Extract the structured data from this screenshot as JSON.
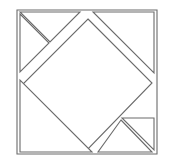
{
  "figure": {
    "title": "Tangram Square Dissection",
    "type": "line-drawing",
    "canvas": {
      "width": 169,
      "height": 166,
      "background": "#ffffff"
    },
    "style": {
      "stroke_color": "#6b6b6b",
      "stroke_width": 1.1,
      "fill_color": "#ffffff",
      "line_join": "miter"
    },
    "pieces": [
      {
        "name": "outer-square-border",
        "label": "Outer Square",
        "points": "17,10 157,10 157,154 17,154"
      },
      {
        "name": "center-diamond",
        "label": "Center Diamond",
        "points": "88,19 152,83 87,150 22,85"
      },
      {
        "name": "top-left-small-triangle-upper",
        "label": "Top Left Upper Small Triangle",
        "points": "20,12 80,12 50,42"
      },
      {
        "name": "top-left-small-triangle-lower",
        "label": "Top Left Lower Small Triangle",
        "points": "20,14 49,43 20,72"
      },
      {
        "name": "top-right-large-triangle",
        "label": "Top Right Large Triangle",
        "points": "93,12 154,12 154,73"
      },
      {
        "name": "bottom-left-large-triangle",
        "label": "Bottom Left Large Triangle",
        "points": "20,80 20,152 92,152"
      },
      {
        "name": "bottom-right-small-triangle-upper",
        "label": "Bottom Right Upper Small Triangle",
        "points": "122,118 154,118 154,150"
      },
      {
        "name": "bottom-right-small-triangle-lower",
        "label": "Bottom Right Lower Small Triangle",
        "points": "121,120 152,152 98,152"
      }
    ]
  }
}
